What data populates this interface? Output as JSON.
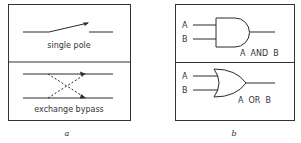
{
  "panel_a": {
    "label": "a",
    "top": {
      "caption": "single pole",
      "symbol": "switch-open-single-pole"
    },
    "bottom": {
      "caption": "exchange bypass",
      "symbol": "crossover-switch"
    }
  },
  "panel_b": {
    "label": "b",
    "top": {
      "caption": "A  AND  B",
      "input_a": "A",
      "input_b": "B",
      "symbol": "and-gate"
    },
    "bottom": {
      "caption": "A  OR  B",
      "input_a": "A",
      "input_b": "B",
      "symbol": "or-gate"
    }
  },
  "colors": {
    "line": "#2a2a2a",
    "background": "#ffffff"
  }
}
